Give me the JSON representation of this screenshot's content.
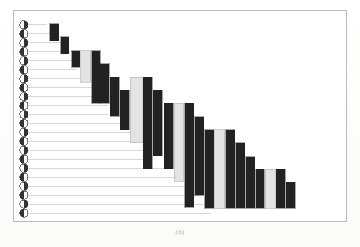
{
  "figure": {
    "caption": "(b)",
    "frame": {
      "x": 13,
      "y": 10,
      "width": 334,
      "height": 212,
      "border_color": "#b9b9b9"
    },
    "background": "#ffffff"
  },
  "colors": {
    "bar_dark": "#1a1a1a",
    "bar_light": "#e2e2e2",
    "bar_light_border": "#b5b5b5",
    "leader_line": "#d2d2d2",
    "marker_fill": "#2b2b2b",
    "marker_stroke": "#555555",
    "frame": "#b9b9b9",
    "caption": "#9a9a9a"
  },
  "chart_data": {
    "type": "bar",
    "title": "",
    "subtitle": "",
    "xlabel": "",
    "ylabel": "",
    "grid": false,
    "legend": "none",
    "orientation": "cascade-waterfall",
    "note": "Descending staircase cascade: each row has a half-filled circular marker at left, a horizontal leader line, and one or more vertical bars (dark or light-grey) stepping rightward and downward.",
    "row_count": 22,
    "categories": [
      "r1",
      "r2",
      "r3",
      "r4",
      "r5",
      "r6",
      "r7",
      "r8",
      "r9",
      "r10",
      "r11",
      "r12",
      "r13",
      "r14",
      "r15",
      "r16",
      "r17",
      "r18",
      "r19",
      "r20",
      "r21",
      "r22"
    ],
    "marker_phases": [
      "right",
      "left",
      "right",
      "left",
      "right",
      "left",
      "right",
      "left",
      "right",
      "left",
      "right",
      "left",
      "right",
      "left",
      "right",
      "left",
      "right",
      "left",
      "right",
      "left",
      "right",
      "left"
    ],
    "leader_line_end_x": [
      33,
      43,
      53,
      63,
      63,
      63,
      74,
      84,
      95,
      95,
      95,
      116,
      126,
      136,
      136,
      136,
      157,
      167,
      178,
      188,
      198,
      198
    ],
    "bars": [
      {
        "x": 36,
        "y": 13,
        "w": 9,
        "h": 17,
        "shade": "dark"
      },
      {
        "x": 47,
        "y": 26,
        "w": 8,
        "h": 17,
        "shade": "dark"
      },
      {
        "x": 58,
        "y": 40,
        "w": 8,
        "h": 17,
        "shade": "dark"
      },
      {
        "x": 67,
        "y": 40,
        "w": 10,
        "h": 32,
        "shade": "light"
      },
      {
        "x": 78,
        "y": 40,
        "w": 9,
        "h": 53,
        "shade": "dark"
      },
      {
        "x": 87,
        "y": 53,
        "w": 9,
        "h": 40,
        "shade": "dark"
      },
      {
        "x": 97,
        "y": 67,
        "w": 9,
        "h": 39,
        "shade": "dark"
      },
      {
        "x": 107,
        "y": 80,
        "w": 9,
        "h": 40,
        "shade": "dark"
      },
      {
        "x": 117,
        "y": 67,
        "w": 12,
        "h": 66,
        "shade": "light"
      },
      {
        "x": 130,
        "y": 67,
        "w": 9,
        "h": 92,
        "shade": "dark"
      },
      {
        "x": 140,
        "y": 80,
        "w": 9,
        "h": 66,
        "shade": "dark"
      },
      {
        "x": 151,
        "y": 93,
        "w": 9,
        "h": 66,
        "shade": "dark"
      },
      {
        "x": 161,
        "y": 93,
        "w": 10,
        "h": 79,
        "shade": "light"
      },
      {
        "x": 172,
        "y": 93,
        "w": 9,
        "h": 105,
        "shade": "dark"
      },
      {
        "x": 182,
        "y": 107,
        "w": 9,
        "h": 79,
        "shade": "dark"
      },
      {
        "x": 192,
        "y": 120,
        "w": 9,
        "h": 79,
        "shade": "dark"
      },
      {
        "x": 202,
        "y": 120,
        "w": 10,
        "h": 79,
        "shade": "light"
      },
      {
        "x": 213,
        "y": 120,
        "w": 9,
        "h": 79,
        "shade": "dark"
      },
      {
        "x": 223,
        "y": 133,
        "w": 9,
        "h": 66,
        "shade": "dark"
      },
      {
        "x": 233,
        "y": 147,
        "w": 9,
        "h": 52,
        "shade": "dark"
      },
      {
        "x": 243,
        "y": 160,
        "w": 9,
        "h": 39,
        "shade": "dark"
      },
      {
        "x": 253,
        "y": 160,
        "w": 10,
        "h": 39,
        "shade": "light"
      },
      {
        "x": 264,
        "y": 160,
        "w": 9,
        "h": 39,
        "shade": "dark"
      },
      {
        "x": 274,
        "y": 173,
        "w": 9,
        "h": 26,
        "shade": "dark"
      }
    ]
  }
}
